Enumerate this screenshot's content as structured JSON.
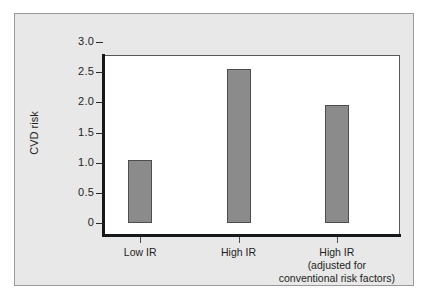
{
  "chart_data": {
    "type": "bar",
    "title": "",
    "subtitle": "",
    "xlabel": "",
    "ylabel": "CVD risk",
    "ylim": [
      0,
      3.0
    ],
    "ytick_labels": [
      "3.0",
      "2.5",
      "2.0",
      "1.5",
      "1.0",
      "0.5",
      "0"
    ],
    "ytick_values": [
      3.0,
      2.5,
      2.0,
      1.5,
      1.0,
      0.5,
      0
    ],
    "grid": false,
    "legend": "none",
    "categories": [
      "Low IR",
      "High IR",
      "High IR (adjusted for conventional risk factors)"
    ],
    "category_label_lines": [
      [
        "Low IR"
      ],
      [
        "High IR"
      ],
      [
        "High IR",
        "(adjusted  for",
        "conventional risk factors)"
      ]
    ],
    "values": [
      1.05,
      2.55,
      1.95
    ],
    "bar_color": "#8b8b8b",
    "bar_edge_color": "#4c4d4f",
    "axis_color": "#17181a",
    "plot_background": "#ffffff",
    "panel_background": "#e8e8e8",
    "panel_border_color": "#9a9a9a"
  }
}
